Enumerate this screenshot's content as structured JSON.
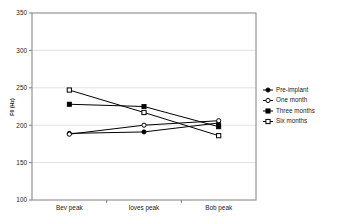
{
  "chart_data": {
    "type": "line",
    "title": "",
    "xlabel": "",
    "ylabel": "F0 (Hz)",
    "categories": [
      "Bev peak",
      "loves peak",
      "Bob peak"
    ],
    "ylim": [
      100,
      350
    ],
    "yticks": [
      100,
      150,
      200,
      250,
      300,
      350
    ],
    "ytick_labels": [
      "100",
      "150",
      "200",
      "250",
      "300",
      "350"
    ],
    "grid": "horizontal",
    "legend_position": "right",
    "series": [
      {
        "name": "Pre-implant",
        "marker": "filled-circle",
        "values": [
          189,
          191,
          203
        ]
      },
      {
        "name": "One month",
        "marker": "open-circle",
        "values": [
          188,
          200,
          206
        ]
      },
      {
        "name": "Three months",
        "marker": "filled-square",
        "values": [
          228,
          225,
          198
        ]
      },
      {
        "name": "Six months",
        "marker": "open-square",
        "values": [
          247,
          217,
          186
        ]
      }
    ]
  },
  "figure": {
    "caption_fragment": ""
  },
  "colors": {
    "line": "#000000",
    "grid": "#d9d9d9",
    "frame": "#808080",
    "text": "#1a1a1a"
  }
}
